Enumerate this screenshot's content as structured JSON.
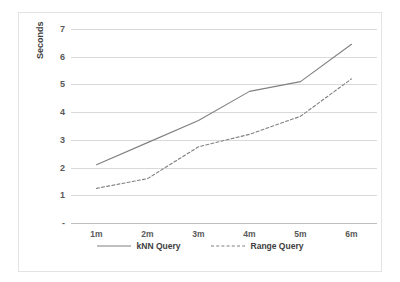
{
  "chart_data": {
    "type": "line",
    "title": "",
    "xlabel": "",
    "ylabel": "Seconds",
    "categories": [
      "1m",
      "2m",
      "3m",
      "4m",
      "5m",
      "6m"
    ],
    "ylim": [
      0,
      7
    ],
    "yticks": [
      "-",
      "1",
      "2",
      "3",
      "4",
      "5",
      "6",
      "7"
    ],
    "ytick_values": [
      0,
      1,
      2,
      3,
      4,
      5,
      6,
      7
    ],
    "grid": true,
    "legend_position": "bottom",
    "series": [
      {
        "name": "kNN Query",
        "style": "solid",
        "color": "#808080",
        "values": [
          2.1,
          2.9,
          3.7,
          4.75,
          5.1,
          6.45
        ]
      },
      {
        "name": "Range Query",
        "style": "dashed",
        "color": "#808080",
        "values": [
          1.25,
          1.6,
          2.75,
          3.2,
          3.85,
          5.2
        ]
      }
    ]
  },
  "legend": {
    "items": [
      {
        "label": "kNN Query"
      },
      {
        "label": "Range Query"
      }
    ]
  }
}
